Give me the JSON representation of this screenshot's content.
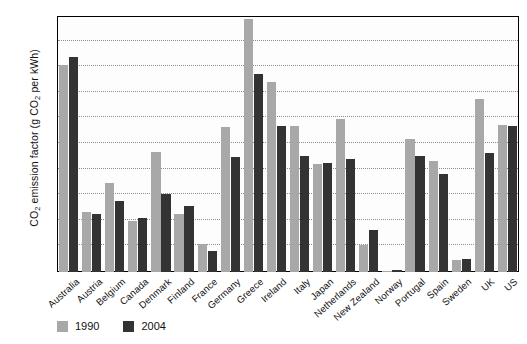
{
  "chart_data": {
    "type": "bar",
    "title": "",
    "xlabel": "",
    "ylabel": "CO2 emission factor (g CO2 per kWh)",
    "ylabel_parts": {
      "pre": "CO",
      "sub1": "2",
      "mid": " emission factor (g CO",
      "sub2": "2",
      "post": " per kWh)"
    },
    "ylim": [
      0,
      1000
    ],
    "yticks": [
      0,
      100,
      200,
      300,
      400,
      500,
      600,
      700,
      800,
      900,
      1000
    ],
    "ytick_labels": [
      "0",
      "100",
      "200",
      "300",
      "400",
      "500",
      "600",
      "700",
      "800",
      "900",
      "1 000"
    ],
    "grid": true,
    "legend_position": "bottom-left",
    "categories": [
      "Australia",
      "Austria",
      "Belgium",
      "Canada",
      "Denmark",
      "Finland",
      "France",
      "Germany",
      "Greece",
      "Ireland",
      "Italy",
      "Japan",
      "Netherlands",
      "New Zealand",
      "Norway",
      "Portugal",
      "Spain",
      "Sweden",
      "UK",
      "US"
    ],
    "series": [
      {
        "name": "1990",
        "color": "#a8a8a8",
        "values": [
          808,
          235,
          348,
          200,
          470,
          225,
          108,
          565,
          990,
          742,
          570,
          420,
          598,
          105,
          3,
          518,
          432,
          45,
          675,
          575
        ]
      },
      {
        "name": "2004",
        "color": "#333333",
        "values": [
          838,
          225,
          278,
          210,
          305,
          258,
          82,
          450,
          775,
          572,
          455,
          425,
          440,
          165,
          8,
          455,
          382,
          52,
          465,
          570
        ]
      }
    ]
  },
  "legend": {
    "items": [
      {
        "label": "1990",
        "color": "#a8a8a8"
      },
      {
        "label": "2004",
        "color": "#333333"
      }
    ]
  }
}
